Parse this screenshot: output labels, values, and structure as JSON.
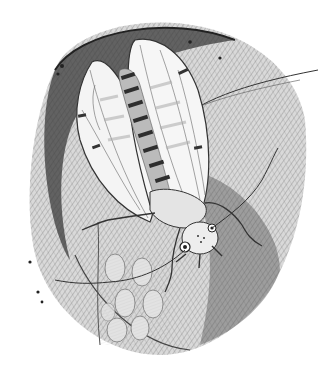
{
  "image": {
    "description": "Pencil illustration of a winged insect with striped abdomen resting on a curled leaf beside a cluster of oval eggs",
    "style": "graphite sketch, crosshatched shading",
    "width": 326,
    "height": 370
  },
  "subjects": [
    {
      "name": "insect",
      "parts": [
        "wings",
        "striped-abdomen",
        "head",
        "antennae",
        "legs"
      ]
    },
    {
      "name": "leaf",
      "parts": [
        "curled-edge",
        "crosshatch-shading"
      ]
    },
    {
      "name": "egg-cluster",
      "count": 7
    }
  ],
  "palette": {
    "background": "#ffffff",
    "dark_graphite": "#2a2a2a",
    "mid_graphite": "#6f6f6f",
    "light_graphite": "#bdbdbd",
    "wing_fill": "#f2f2f2",
    "egg_fill": "#dedede"
  }
}
